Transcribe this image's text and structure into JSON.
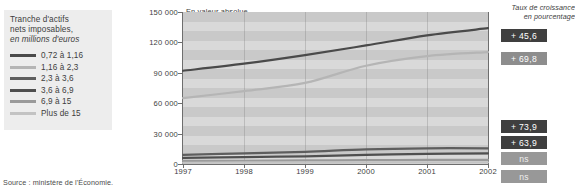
{
  "legend": {
    "title_line1": "Tranche d'actifs",
    "title_line2": "nets imposables,",
    "title_line3": "en millions d'euros",
    "items": [
      {
        "label": "0,72 à 1,16",
        "color": "#4a4a4a",
        "thickness": 3
      },
      {
        "label": "1,16 à 2,3",
        "color": "#b5b5b5",
        "thickness": 3
      },
      {
        "label": "2,3 à 3,6",
        "color": "#5e5e5e",
        "thickness": 3
      },
      {
        "label": "3,6 à 6,9",
        "color": "#4f4f4f",
        "thickness": 3
      },
      {
        "label": "6,9 à 15",
        "color": "#9a9a9a",
        "thickness": 3
      },
      {
        "label": "Plus de 15",
        "color": "#c3c3c3",
        "thickness": 3
      }
    ]
  },
  "source": "Source : ministère de l'Économie.",
  "panel_labels": {
    "absolute": "En valeur absolue",
    "rate_line1": "Taux de croissance",
    "rate_line2": "en pourcentage"
  },
  "rate_boxes": [
    {
      "value": "+ 45,6",
      "series": "0,72 à 1,16",
      "bg": "#3f3f3f",
      "top": 29
    },
    {
      "value": "+ 69,8",
      "series": "1,16 à 2,3",
      "bg": "#8d8d8d",
      "top": 52
    },
    {
      "value": "+ 73,9",
      "series": "2,3 à 3,6",
      "bg": "#3f3f3f",
      "top": 120
    },
    {
      "value": "+ 63,9",
      "series": "3,6 à 6,9",
      "bg": "#3f3f3f",
      "top": 136
    },
    {
      "value": "ns",
      "series": "6,9 à 15",
      "bg": "#989898",
      "top": 152
    },
    {
      "value": "ns",
      "series": "Plus de 15",
      "bg": "#989898",
      "top": 170
    }
  ],
  "chart_data": {
    "type": "line",
    "title": "En valeur absolue",
    "xlabel": "",
    "ylabel": "en millions d'euros",
    "x": [
      1997,
      1998,
      1999,
      2000,
      2001,
      2002
    ],
    "xticklabels": [
      "1997",
      "1998",
      "1999",
      "2000",
      "2001",
      "2002"
    ],
    "yticks": [
      0,
      30000,
      60000,
      90000,
      120000,
      150000
    ],
    "yticklabels": [
      "0",
      "30 000",
      "60 000",
      "90 000",
      "120 000",
      "150 000"
    ],
    "ylim": [
      0,
      150000
    ],
    "grid": "horizontal-bands",
    "legend_position": "left-outside",
    "series": [
      {
        "name": "0,72 à 1,16",
        "color": "#4a4a4a",
        "growth_pct": "+ 45,6",
        "values": [
          92000,
          99000,
          107500,
          117000,
          127000,
          134000
        ]
      },
      {
        "name": "1,16 à 2,3",
        "color": "#b5b5b5",
        "growth_pct": "+ 69,8",
        "values": [
          65000,
          72000,
          80000,
          97000,
          106500,
          110500
        ]
      },
      {
        "name": "2,3 à 3,6",
        "color": "#5e5e5e",
        "growth_pct": "+ 73,9",
        "values": [
          9000,
          10500,
          12000,
          14500,
          15500,
          15500
        ]
      },
      {
        "name": "3,6 à 6,9",
        "color": "#4f4f4f",
        "growth_pct": "+ 63,9",
        "values": [
          6000,
          6800,
          7600,
          9000,
          10000,
          10500
        ]
      },
      {
        "name": "6,9 à 15",
        "color": "#9a9a9a",
        "growth_pct": "ns",
        "values": [
          3000,
          3200,
          3500,
          3800,
          4000,
          4100
        ]
      },
      {
        "name": "Plus de 15",
        "color": "#c3c3c3",
        "growth_pct": "ns",
        "values": [
          1200,
          1300,
          1400,
          1500,
          1600,
          1700
        ]
      }
    ]
  }
}
